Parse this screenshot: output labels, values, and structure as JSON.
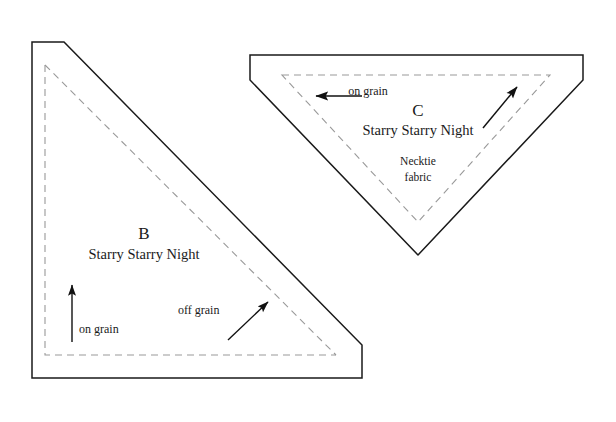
{
  "document": {
    "title": "Quilt pattern template pieces B and C",
    "background_color": "#ffffff",
    "outline_color": "#1a1a1a",
    "seam_line_color": "#999999",
    "text_color": "#1a1a1a"
  },
  "pieces": [
    {
      "id": "B",
      "letter": "B",
      "fabric_title": "Starry Starry Night",
      "fabric_note": "",
      "shape": "right-triangle-with-cut-corners",
      "outline_points": "32,42 64,42 362,345 362,378 32,378",
      "seam_points": "45,65 45,355 336,355",
      "grain_markers": [
        {
          "label": "on grain",
          "direction": "up",
          "x1": 72,
          "y1": 342,
          "x2": 72,
          "y2": 285
        },
        {
          "label": "off grain",
          "direction": "up-right",
          "x1": 228,
          "y1": 340,
          "x2": 268,
          "y2": 302
        }
      ]
    },
    {
      "id": "C",
      "letter": "C",
      "fabric_title": "Starry Starry Night",
      "fabric_note_line1": "Necktie",
      "fabric_note_line2": "fabric",
      "shape": "inverted-triangle-with-cut-corners",
      "outline_points": "250,55 583,55 583,80 418,255 250,80",
      "seam_points": "282,75 550,75 418,222",
      "grain_markers": [
        {
          "label": "on grain",
          "direction": "left",
          "x1": 362,
          "y1": 96,
          "x2": 316,
          "y2": 96
        },
        {
          "label": "",
          "direction": "up-right",
          "x1": 483,
          "y1": 128,
          "x2": 517,
          "y2": 87
        }
      ]
    }
  ],
  "labels": {
    "piece_b_letter": "B",
    "piece_b_title": "Starry Starry Night",
    "piece_b_on_grain": "on grain",
    "piece_b_off_grain": "off grain",
    "piece_c_letter": "C",
    "piece_c_title": "Starry Starry Night",
    "piece_c_note_line1": "Necktie",
    "piece_c_note_line2": "fabric",
    "piece_c_on_grain": "on grain"
  }
}
